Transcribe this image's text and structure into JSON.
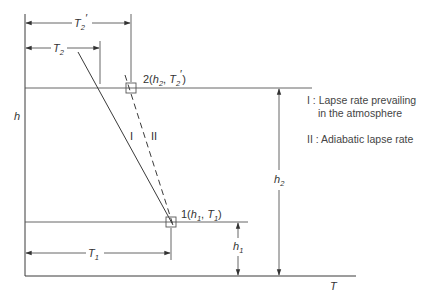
{
  "diagram": {
    "type": "temperature-altitude lapse rate diagram",
    "axes": {
      "vertical_label": "h",
      "horizontal_label": "T"
    },
    "points": [
      {
        "id": "1",
        "label_prefix": "1(",
        "h": "h",
        "h_sub": "1",
        "sep": ", ",
        "t": "T",
        "t_sub": "1",
        "label_suffix": ")"
      },
      {
        "id": "2",
        "label_prefix": "2(",
        "h": "h",
        "h_sub": "2",
        "sep": ", ",
        "t": "T",
        "t_sub": "2",
        "t_prime": "′",
        "label_suffix": ")"
      }
    ],
    "lines": [
      {
        "id": "I",
        "label": "I",
        "style": "solid"
      },
      {
        "id": "II",
        "label": "II",
        "style": "dashed"
      }
    ],
    "dimensions": {
      "T2_prime": {
        "base": "T",
        "sub": "2",
        "prime": "′"
      },
      "T2": {
        "base": "T",
        "sub": "2"
      },
      "T1": {
        "base": "T",
        "sub": "1"
      },
      "h1": {
        "base": "h",
        "sub": "1"
      },
      "h2": {
        "base": "h",
        "sub": "2"
      }
    },
    "legend": [
      {
        "key": "I",
        "text_line1": "I : Lapse rate prevailing",
        "text_line2": "in the atmosphere"
      },
      {
        "key": "II",
        "text_line1": "II : Adiabatic lapse rate"
      }
    ]
  }
}
